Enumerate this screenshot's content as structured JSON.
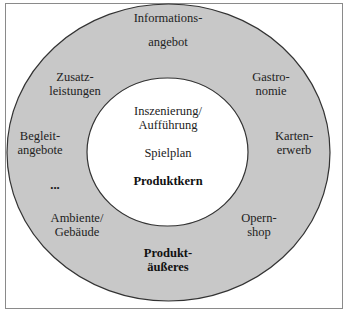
{
  "diagram": {
    "type": "concentric-circles",
    "colors": {
      "outer_ring_fill": "#c8c8c8",
      "inner_circle_fill": "#ffffff",
      "stroke": "#333333",
      "frame": "#8a8a8a"
    },
    "core": {
      "items": [
        {
          "line1": "Inszenierung/",
          "line2": "Aufführung"
        },
        {
          "line1": "Spielplan"
        }
      ],
      "title": "Produktkern"
    },
    "outer": {
      "items": [
        {
          "line1": "Informations-",
          "line2": "angebot"
        },
        {
          "line1": "Zusatz-",
          "line2": "leistungen"
        },
        {
          "line1": "Gastro-",
          "line2": "nomie"
        },
        {
          "line1": "Begleit-",
          "line2": "angebote"
        },
        {
          "line1": "Karten-",
          "line2": "erwerb"
        },
        {
          "line1": "..."
        },
        {
          "line1": "Ambiente/",
          "line2": "Gebäude"
        },
        {
          "line1": "Opern-",
          "line2": "shop"
        }
      ],
      "title": {
        "line1": "Produkt-",
        "line2": "äußeres"
      }
    }
  }
}
